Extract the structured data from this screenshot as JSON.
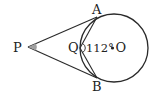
{
  "diagram": {
    "type": "geometry",
    "colors": {
      "stroke": "#2a2a2a",
      "angle_fill": "#a0a0a0",
      "background": "#ffffff"
    },
    "labels": {
      "P": "P",
      "A": "A",
      "B": "B",
      "Q": "Q",
      "O": "O",
      "angle": "112°"
    },
    "points": {
      "P": [
        28,
        47
      ],
      "A": [
        97,
        18
      ],
      "B": [
        97,
        77
      ],
      "Q": [
        80,
        48
      ],
      "O": [
        113,
        48
      ]
    },
    "circle": {
      "cx": 114,
      "cy": 48,
      "r": 34
    }
  }
}
